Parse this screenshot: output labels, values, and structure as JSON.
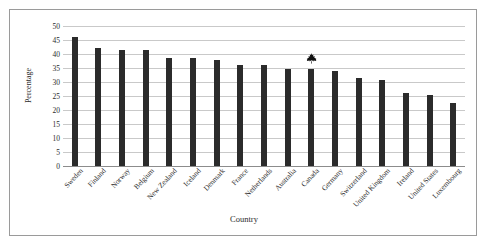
{
  "chart_data": {
    "type": "bar",
    "title": "",
    "xlabel": "Country",
    "ylabel": "Percentage",
    "ylim": [
      0,
      50
    ],
    "ytick_values": [
      0,
      5,
      10,
      15,
      20,
      25,
      30,
      35,
      40,
      45,
      50
    ],
    "grid": true,
    "legend": "none",
    "bar_color": "#2b2b2b",
    "categories": [
      "Sweden",
      "Finland",
      "Norway",
      "Belgium",
      "New Zealand",
      "Iceland",
      "Denmark",
      "France",
      "Netherlands",
      "Australia",
      "Canada",
      "Germany",
      "Switzerland",
      "United Kingdom",
      "Ireland",
      "United States",
      "Luxembourg"
    ],
    "values": [
      46,
      42,
      41.5,
      41.5,
      38.5,
      38.5,
      37.8,
      36.2,
      36,
      34.8,
      34.5,
      34,
      31.5,
      30.8,
      26,
      25.5,
      22.5
    ],
    "annotations": [
      {
        "name": "maple-leaf-marker",
        "icon": "maple-leaf-icon",
        "category": "Canada",
        "value": 34.5
      }
    ]
  }
}
